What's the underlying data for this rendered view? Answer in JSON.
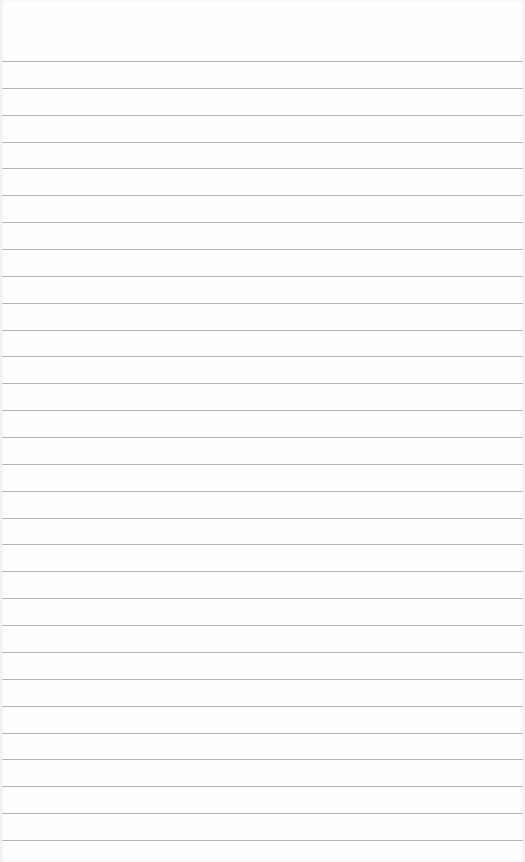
{
  "page": {
    "type": "lined-notepad",
    "background_color": "#fefefe",
    "rule_color": "#a9a9a9",
    "rule_count": 30,
    "first_rule_y": 61,
    "rule_spacing": 26.86
  }
}
